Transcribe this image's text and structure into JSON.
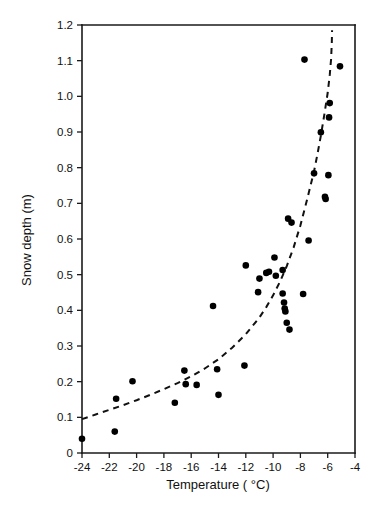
{
  "chart_data": {
    "type": "scatter",
    "title": "",
    "xlabel": "Temperature ( °C)",
    "ylabel": "Snow depth (m)",
    "xlim": [
      -24,
      -4
    ],
    "ylim": [
      0,
      1.2
    ],
    "xticks": [
      -24,
      -22,
      -20,
      -18,
      -16,
      -14,
      -12,
      -10,
      -8,
      -6,
      -4
    ],
    "xticklabels": [
      "-24",
      "-22",
      "-20",
      "-18",
      "-16",
      "-14",
      "-12",
      "-10",
      "-8",
      "-6",
      "-4"
    ],
    "yticks": [
      0,
      0.1,
      0.2,
      0.3,
      0.4,
      0.5,
      0.6,
      0.7,
      0.8,
      0.9,
      1.0,
      1.1,
      1.2
    ],
    "yticklabels": [
      "0",
      "0.1",
      "0.2",
      "0.3",
      "0.4",
      "0.5",
      "0.6",
      "0.7",
      "0.8",
      "0.9",
      "1.0",
      "1.1",
      "1.2"
    ],
    "grid": false,
    "legend": false,
    "marker": "filled-circle",
    "marker_color": "#000000",
    "series": [
      {
        "name": "Observations",
        "type": "scatter",
        "points": [
          [
            -24.0,
            0.04
          ],
          [
            -21.6,
            0.06
          ],
          [
            -21.5,
            0.152
          ],
          [
            -20.3,
            0.201
          ],
          [
            -17.2,
            0.141
          ],
          [
            -16.5,
            0.231
          ],
          [
            -16.4,
            0.193
          ],
          [
            -15.6,
            0.191
          ],
          [
            -14.4,
            0.412
          ],
          [
            -14.1,
            0.235
          ],
          [
            -14.0,
            0.163
          ],
          [
            -12.1,
            0.245
          ],
          [
            -12.0,
            0.526
          ],
          [
            -11.1,
            0.451
          ],
          [
            -11.0,
            0.489
          ],
          [
            -10.5,
            0.505
          ],
          [
            -10.3,
            0.508
          ],
          [
            -9.9,
            0.548
          ],
          [
            -9.8,
            0.497
          ],
          [
            -9.3,
            0.447
          ],
          [
            -9.3,
            0.513
          ],
          [
            -9.2,
            0.422
          ],
          [
            -9.15,
            0.405
          ],
          [
            -9.1,
            0.397
          ],
          [
            -9.0,
            0.365
          ],
          [
            -8.8,
            0.346
          ],
          [
            -8.65,
            0.646
          ],
          [
            -8.9,
            0.657
          ],
          [
            -7.8,
            0.446
          ],
          [
            -7.7,
            1.103
          ],
          [
            -7.4,
            0.596
          ],
          [
            -7.0,
            0.784
          ],
          [
            -6.5,
            0.899
          ],
          [
            -6.2,
            0.718
          ],
          [
            -6.15,
            0.712
          ],
          [
            -5.95,
            0.779
          ],
          [
            -5.9,
            0.941
          ],
          [
            -5.85,
            0.981
          ],
          [
            -5.1,
            1.084
          ]
        ]
      },
      {
        "name": "Fitted exponential trend",
        "type": "line",
        "style": "dashed",
        "points": [
          [
            -24.0,
            0.095
          ],
          [
            -23.0,
            0.108
          ],
          [
            -22.0,
            0.121
          ],
          [
            -21.0,
            0.134
          ],
          [
            -20.0,
            0.148
          ],
          [
            -19.0,
            0.163
          ],
          [
            -18.0,
            0.179
          ],
          [
            -17.0,
            0.196
          ],
          [
            -16.0,
            0.215
          ],
          [
            -15.0,
            0.237
          ],
          [
            -14.0,
            0.263
          ],
          [
            -13.0,
            0.295
          ],
          [
            -12.0,
            0.333
          ],
          [
            -11.0,
            0.38
          ],
          [
            -10.5,
            0.409
          ],
          [
            -10.0,
            0.442
          ],
          [
            -9.5,
            0.48
          ],
          [
            -9.0,
            0.524
          ],
          [
            -8.5,
            0.576
          ],
          [
            -8.0,
            0.638
          ],
          [
            -7.5,
            0.712
          ],
          [
            -7.0,
            0.79
          ],
          [
            -6.75,
            0.838
          ],
          [
            -6.5,
            0.89
          ],
          [
            -6.25,
            0.948
          ],
          [
            -6.0,
            1.01
          ],
          [
            -5.85,
            1.06
          ],
          [
            -5.75,
            1.105
          ],
          [
            -5.7,
            1.15
          ],
          [
            -5.68,
            1.185
          ]
        ]
      }
    ]
  },
  "axes": {
    "x_axis_name": "temperature-axis",
    "y_axis_name": "snow-depth-axis"
  }
}
